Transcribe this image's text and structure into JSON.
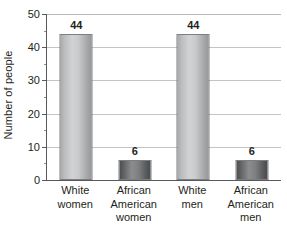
{
  "chart_data": {
    "type": "bar",
    "title": "",
    "subtitle": "",
    "xlabel": "",
    "ylabel": "Number of people",
    "categories": [
      "White women",
      "African American women",
      "White men",
      "African American men"
    ],
    "category_lines": [
      [
        "White",
        "women"
      ],
      [
        "African",
        "American",
        "women"
      ],
      [
        "White",
        "men"
      ],
      [
        "African",
        "American",
        "men"
      ]
    ],
    "values": [
      44,
      6,
      44,
      6
    ],
    "value_labels": [
      "44",
      "6",
      "44",
      "6"
    ],
    "bar_styles": [
      "light",
      "dark",
      "light",
      "dark"
    ],
    "ylim": [
      0,
      50
    ],
    "ytick_values": [
      0,
      10,
      20,
      30,
      40,
      50
    ],
    "ytick_labels": [
      "0",
      "10",
      "20",
      "30",
      "40",
      "50"
    ],
    "yminor_values": [
      5,
      15,
      25,
      35,
      45
    ],
    "grid": true,
    "grid_axis": "y",
    "legend": null,
    "legend_position": "none",
    "colors": {
      "bar_light_mid": "#d2d3d5",
      "bar_light_edge": "#96989a",
      "bar_dark_mid": "#8c8d8f",
      "bar_dark_edge": "#48494b",
      "gridline": "#c3c4c6",
      "axis": "#58595b",
      "text": "#231f20",
      "background": "#ffffff"
    }
  }
}
